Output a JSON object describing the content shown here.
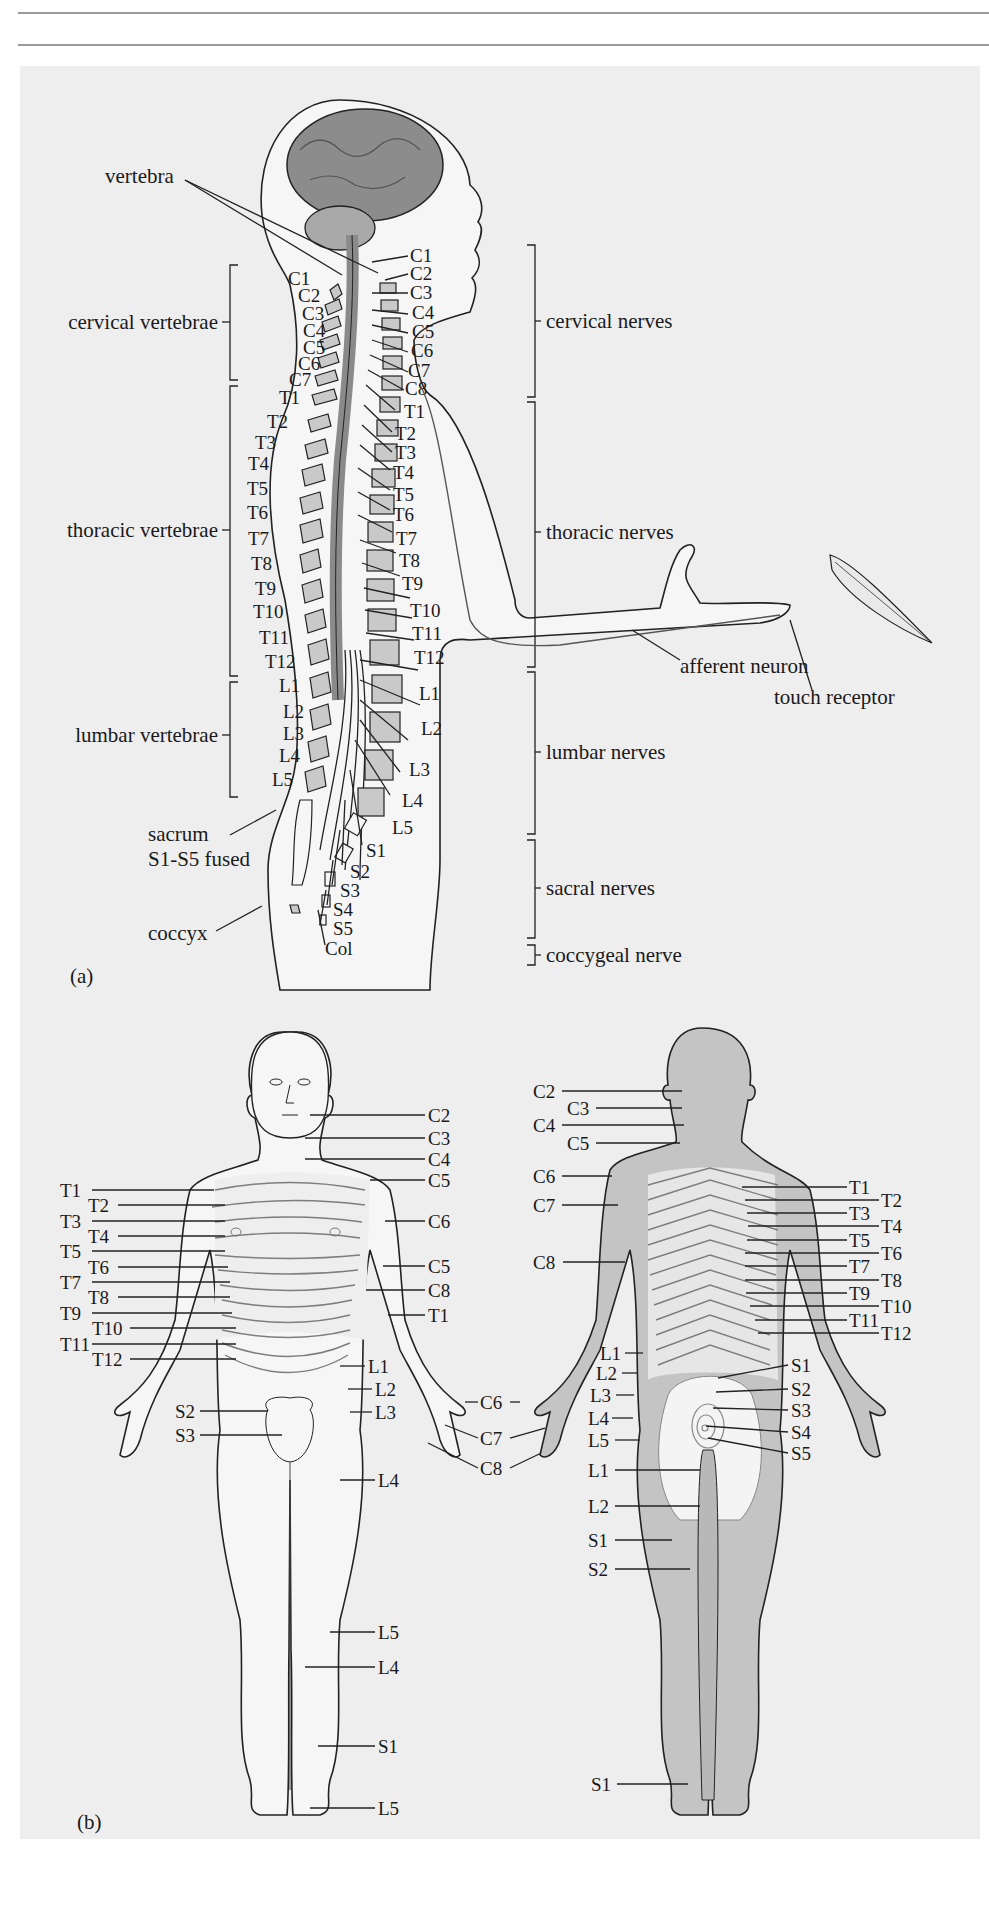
{
  "figure": {
    "panel_a": {
      "tag": "(a)",
      "callouts": {
        "vertebra": "vertebra",
        "sacrum_1": "sacrum",
        "sacrum_2": "S1-S5 fused",
        "coccyx": "coccyx",
        "afferent": "afferent neuron",
        "touch": "touch receptor"
      },
      "vertebrae_groups": [
        {
          "label": "cervical vertebrae"
        },
        {
          "label": "thoracic vertebrae"
        },
        {
          "label": "lumbar vertebrae"
        }
      ],
      "nerve_groups": [
        {
          "label": "cervical nerves"
        },
        {
          "label": "thoracic nerves"
        },
        {
          "label": "lumbar nerves"
        },
        {
          "label": "sacral nerves"
        },
        {
          "label": "coccygeal nerve"
        }
      ],
      "vertebra_labels": [
        "C1",
        "C2",
        "C3",
        "C4",
        "C5",
        "C6",
        "C7",
        "T1",
        "T2",
        "T3",
        "T4",
        "T5",
        "T6",
        "T7",
        "T8",
        "T9",
        "T10",
        "T11",
        "T12",
        "L1",
        "L2",
        "L3",
        "L4",
        "L5"
      ],
      "nerve_labels": [
        "C1",
        "C2",
        "C3",
        "C4",
        "C5",
        "C6",
        "C7",
        "C8",
        "T1",
        "T2",
        "T3",
        "T4",
        "T5",
        "T6",
        "T7",
        "T8",
        "T9",
        "T10",
        "T11",
        "T12",
        "L1",
        "L2",
        "L3",
        "L4",
        "L5",
        "S1",
        "S2",
        "S3",
        "S4",
        "S5",
        "Col"
      ]
    },
    "panel_b": {
      "tag": "(b)",
      "front": {
        "left_labels": [
          "T1",
          "T2",
          "T3",
          "T4",
          "T5",
          "T6",
          "T7",
          "T8",
          "T9",
          "T10",
          "T11",
          "T12",
          "S2",
          "S3"
        ],
        "right_labels": [
          "C2",
          "C3",
          "C4",
          "C5",
          "C6",
          "C5",
          "C8",
          "T1",
          "L1",
          "L2",
          "L3",
          "L4",
          "L5",
          "L4",
          "S1",
          "L5"
        ]
      },
      "hands": [
        "C6",
        "C7",
        "C8"
      ],
      "back": {
        "left_labels": [
          "C2",
          "C3",
          "C4",
          "C5",
          "C6",
          "C7",
          "C8",
          "L1",
          "L2",
          "L3",
          "L4",
          "L5",
          "L1",
          "L2",
          "S1",
          "S2",
          "S1"
        ],
        "right_labels": [
          "T1",
          "T2",
          "T3",
          "T4",
          "T5",
          "T6",
          "T7",
          "T8",
          "T9",
          "T10",
          "T11",
          "T12",
          "S1",
          "S2",
          "S3",
          "S4",
          "S5"
        ]
      }
    }
  }
}
